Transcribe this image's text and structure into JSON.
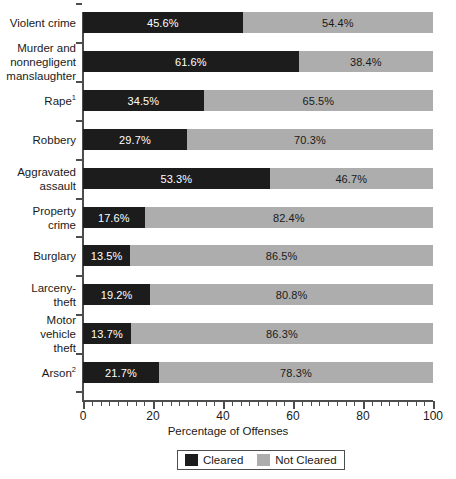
{
  "chart_data": {
    "type": "bar",
    "subtype": "stacked-horizontal-100pct",
    "title": "",
    "xlabel": "Percentage of Offenses",
    "ylabel": "",
    "xlim": [
      0,
      100
    ],
    "xticks": [
      0,
      20,
      40,
      60,
      80,
      100
    ],
    "xtick_labels": [
      "0",
      "20",
      "40",
      "60",
      "80",
      "100"
    ],
    "minor_tick_interval": 2.5,
    "grid": false,
    "legend_position": "bottom-center",
    "categories": [
      "Violent crime",
      "Murder and nonnegligent manslaughter",
      "Rape",
      "Robbery",
      "Aggravated assault",
      "Property crime",
      "Burglary",
      "Larceny-theft",
      "Motor vehicle theft",
      "Arson"
    ],
    "series": [
      {
        "name": "Cleared",
        "color": "#1c1c1c",
        "values": [
          45.6,
          61.6,
          34.5,
          29.7,
          53.3,
          17.6,
          13.5,
          19.2,
          13.7,
          21.7
        ]
      },
      {
        "name": "Not Cleared",
        "color": "#adadad",
        "values": [
          54.4,
          38.4,
          65.5,
          70.3,
          46.7,
          82.4,
          86.5,
          80.8,
          86.3,
          78.3
        ]
      }
    ],
    "bars": [
      {
        "label_lines": [
          "Violent crime"
        ],
        "footnote": "",
        "cleared": 45.6,
        "not_cleared": 54.4,
        "cleared_label": "45.6%",
        "not_cleared_label": "54.4%"
      },
      {
        "label_lines": [
          "Murder and",
          "nonnegligent",
          "manslaughter"
        ],
        "footnote": "",
        "cleared": 61.6,
        "not_cleared": 38.4,
        "cleared_label": "61.6%",
        "not_cleared_label": "38.4%"
      },
      {
        "label_lines": [
          "Rape"
        ],
        "footnote": "1",
        "cleared": 34.5,
        "not_cleared": 65.5,
        "cleared_label": "34.5%",
        "not_cleared_label": "65.5%"
      },
      {
        "label_lines": [
          "Robbery"
        ],
        "footnote": "",
        "cleared": 29.7,
        "not_cleared": 70.3,
        "cleared_label": "29.7%",
        "not_cleared_label": "70.3%"
      },
      {
        "label_lines": [
          "Aggravated",
          "assault"
        ],
        "footnote": "",
        "cleared": 53.3,
        "not_cleared": 46.7,
        "cleared_label": "53.3%",
        "not_cleared_label": "46.7%"
      },
      {
        "label_lines": [
          "Property",
          "crime"
        ],
        "footnote": "",
        "cleared": 17.6,
        "not_cleared": 82.4,
        "cleared_label": "17.6%",
        "not_cleared_label": "82.4%"
      },
      {
        "label_lines": [
          "Burglary"
        ],
        "footnote": "",
        "cleared": 13.5,
        "not_cleared": 86.5,
        "cleared_label": "13.5%",
        "not_cleared_label": "86.5%"
      },
      {
        "label_lines": [
          "Larceny-",
          "theft"
        ],
        "footnote": "",
        "cleared": 19.2,
        "not_cleared": 80.8,
        "cleared_label": "19.2%",
        "not_cleared_label": "80.8%"
      },
      {
        "label_lines": [
          "Motor",
          "vehicle",
          "theft"
        ],
        "footnote": "",
        "cleared": 13.7,
        "not_cleared": 86.3,
        "cleared_label": "13.7%",
        "not_cleared_label": "86.3%"
      },
      {
        "label_lines": [
          "Arson"
        ],
        "footnote": "2",
        "cleared": 21.7,
        "not_cleared": 78.3,
        "cleared_label": "21.7%",
        "not_cleared_label": "78.3%"
      }
    ],
    "legend": [
      {
        "label": "Cleared",
        "color": "#1c1c1c"
      },
      {
        "label": "Not Cleared",
        "color": "#adadad"
      }
    ]
  }
}
